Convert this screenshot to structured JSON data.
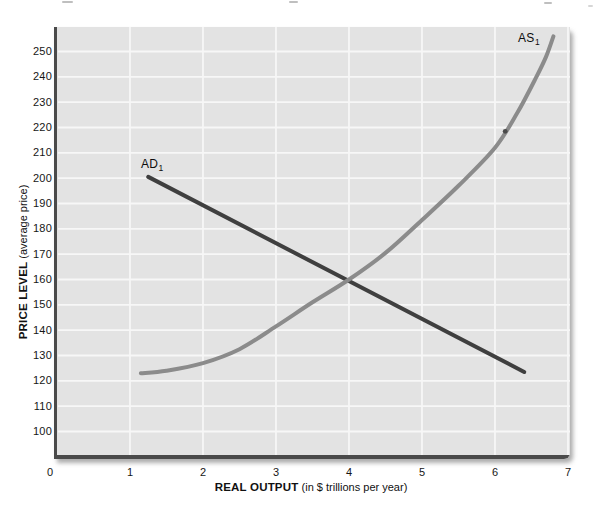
{
  "figure": {
    "y_axis_title": {
      "bold": "PRICE LEVEL",
      "normal": "(average price)"
    },
    "x_axis_title": {
      "bold": "REAL OUTPUT",
      "normal": "(in $ trillions per year)"
    },
    "curve_labels": {
      "ad": {
        "text": "AD",
        "sub": "1"
      },
      "as": {
        "text": "AS",
        "sub": "1"
      }
    }
  },
  "chart_data": {
    "type": "line",
    "title": "",
    "xlabel": "REAL OUTPUT (in $ trillions per year)",
    "ylabel": "PRICE LEVEL (average price)",
    "xlim": [
      0,
      7
    ],
    "ylim": [
      90.7,
      259.7
    ],
    "x_ticks": [
      0,
      1,
      2,
      3,
      4,
      5,
      6,
      7
    ],
    "y_ticks": [
      250,
      240,
      230,
      220,
      210,
      200,
      190,
      180,
      170,
      160,
      150,
      140,
      130,
      120,
      110,
      100
    ],
    "grid": true,
    "legend_position": "none",
    "colors": {
      "plot_background": "#e3e3e3",
      "gridline": "#f7f7f7",
      "axis": "#4a4a4a",
      "ad_curve": "#3f3f3f",
      "as_curve": "#8b8b8b",
      "speck": "#4a4a4a"
    },
    "series": [
      {
        "name": "AD1",
        "label": "AD1",
        "shape": "linear",
        "stroke_width": 4,
        "points": [
          [
            1.25,
            200.5
          ],
          [
            6.4,
            123.5
          ]
        ]
      },
      {
        "name": "AS1",
        "label": "AS1",
        "shape": "smooth",
        "stroke_width": 4,
        "points": [
          [
            1.15,
            123
          ],
          [
            1.5,
            124
          ],
          [
            2,
            127
          ],
          [
            2.5,
            132.5
          ],
          [
            3,
            141.5
          ],
          [
            3.5,
            151
          ],
          [
            4,
            160
          ],
          [
            4.5,
            170.5
          ],
          [
            5,
            183.5
          ],
          [
            5.5,
            197
          ],
          [
            6,
            212
          ],
          [
            6.3,
            225.5
          ],
          [
            6.55,
            239
          ],
          [
            6.7,
            248
          ],
          [
            6.8,
            256
          ]
        ]
      }
    ],
    "speck_dot": {
      "x": 6.14,
      "y": 218.5
    }
  }
}
